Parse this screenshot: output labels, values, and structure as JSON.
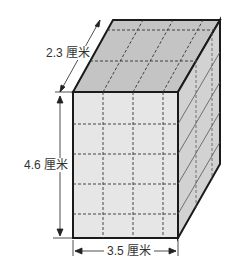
{
  "figure": {
    "type": "rectangular-prism",
    "labels": {
      "depth": "2.3 厘米",
      "height": "4.6 厘米",
      "width": "3.5 厘米"
    },
    "grid": {
      "front_columns": 4,
      "front_rows": 5,
      "top_rows": 3,
      "side_columns": 3
    },
    "colors": {
      "front_face": "#e6e6e6",
      "top_face": "#c4c4c4",
      "side_face": "#d2d2d2",
      "edge": "#1a1a1a"
    }
  }
}
